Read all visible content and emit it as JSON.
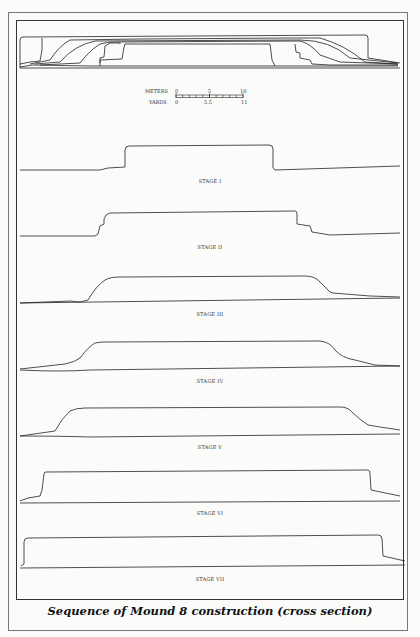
{
  "caption": "Sequence of Mound 8 construction (cross section)",
  "scale_bar": {
    "meters_label": "METERS",
    "meters_ticks": [
      "0",
      "5",
      "10"
    ],
    "yards_label": "YARDS",
    "yards_ticks": [
      "0",
      "5.5",
      "11"
    ]
  },
  "stages": [
    {
      "label": "STAGE I"
    },
    {
      "label": "STAGE II"
    },
    {
      "label": "STAGE III"
    },
    {
      "label": "STAGE IV"
    },
    {
      "label": "STAGE V"
    },
    {
      "label": "STAGE VI"
    },
    {
      "label": "STAGE VII"
    }
  ],
  "colors": {
    "line": "#222222",
    "frame": "#333333",
    "background": "#fbfbfa"
  }
}
